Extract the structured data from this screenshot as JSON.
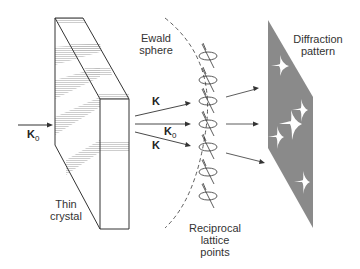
{
  "labels": {
    "crystal": "Thin crystal",
    "crystal_line1": "Thin",
    "crystal_line2": "crystal",
    "ewald_line1": "Ewald",
    "ewald_line2": "sphere",
    "diffraction_line1": "Diffraction",
    "diffraction_line2": "pattern",
    "reciprocal_line1": "Reciprocal",
    "reciprocal_line2": "lattice",
    "reciprocal_line3": "points",
    "k_incident": "K",
    "k_incident_sub": "0",
    "k_upper": "K",
    "k_mid": "K",
    "k_mid_sub": "0",
    "k_lower": "K"
  },
  "colors": {
    "line": "#333333",
    "pattern_fill": "#8a8a8a",
    "spot": "#ffffff",
    "hatch": "#bbbbbb"
  }
}
